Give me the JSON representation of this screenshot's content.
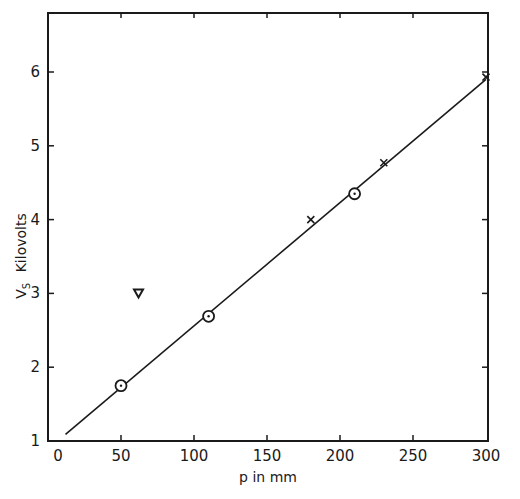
{
  "chart_data": {
    "type": "scatter",
    "title": "",
    "xlabel": "p in mm",
    "ylabel": "V_S  Kilovolts",
    "ylabel_main": "V",
    "ylabel_sub": "S",
    "ylabel_unit": "Kilovolts",
    "xlim": [
      0,
      300
    ],
    "ylim": [
      1,
      6.8
    ],
    "x_ticks": [
      0,
      50,
      100,
      150,
      200,
      250,
      300
    ],
    "x_tick_labels": [
      "0",
      "50",
      "100",
      "150",
      "200",
      "250",
      "300"
    ],
    "y_ticks": [
      1,
      2,
      3,
      4,
      5,
      6
    ],
    "y_tick_labels": [
      "1",
      "2",
      "3",
      "4",
      "5",
      "6"
    ],
    "grid": false,
    "legend": null,
    "series": [
      {
        "name": "circles",
        "marker": "circle-dot",
        "points": [
          {
            "x": 50,
            "y": 1.75
          },
          {
            "x": 110,
            "y": 2.69
          },
          {
            "x": 210,
            "y": 4.35
          }
        ]
      },
      {
        "name": "crosses",
        "marker": "cross",
        "points": [
          {
            "x": 180,
            "y": 4.0
          },
          {
            "x": 230,
            "y": 4.77
          },
          {
            "x": 300,
            "y": 5.93
          }
        ]
      },
      {
        "name": "triangle",
        "marker": "triangle-down",
        "points": [
          {
            "x": 62,
            "y": 3.0
          }
        ]
      }
    ],
    "fit_line": {
      "name": "linear fit",
      "x": [
        12,
        300
      ],
      "y": [
        1.09,
        5.9
      ]
    }
  }
}
